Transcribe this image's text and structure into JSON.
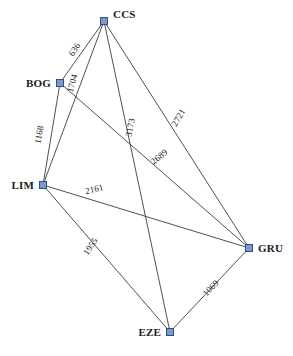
{
  "chart_data": {
    "type": "diagram",
    "title": "",
    "subtitle": "",
    "xlabel": "",
    "ylabel": "",
    "grid": false,
    "legend": "none",
    "background": "#ffffff",
    "node_fill": "#7b98c6",
    "node_stroke": "#2b4f86",
    "edge_color": "#3c3c3c",
    "label_color": "#1a1a1a",
    "nodes": [
      {
        "id": "CCS",
        "label": "CCS",
        "x": 104,
        "y": 21,
        "label_dx": 9,
        "label_dy": -3,
        "anchor": "start"
      },
      {
        "id": "BOG",
        "label": "BOG",
        "x": 60,
        "y": 83,
        "label_dx": -9,
        "label_dy": 4,
        "anchor": "end"
      },
      {
        "id": "LIM",
        "label": "LIM",
        "x": 43,
        "y": 185,
        "label_dx": -9,
        "label_dy": 4,
        "anchor": "end"
      },
      {
        "id": "GRU",
        "label": "GRU",
        "x": 249,
        "y": 248,
        "label_dx": 9,
        "label_dy": 4,
        "anchor": "start"
      },
      {
        "id": "EZE",
        "label": "EZE",
        "x": 170,
        "y": 332,
        "label_dx": -9,
        "label_dy": 4,
        "anchor": "end"
      }
    ],
    "edges": [
      {
        "source": "CCS",
        "target": "BOG",
        "weight": 636,
        "label": "636",
        "label_x": 77,
        "label_y": 51,
        "rotation": -58
      },
      {
        "source": "CCS",
        "target": "LIM",
        "weight": 1704,
        "label": "1704",
        "label_x": 75,
        "label_y": 84,
        "rotation": -74
      },
      {
        "source": "BOG",
        "target": "LIM",
        "weight": 1168,
        "label": "1168",
        "label_x": 42,
        "label_y": 135,
        "rotation": -80
      },
      {
        "source": "CCS",
        "target": "EZE",
        "weight": 3173,
        "label": "3173",
        "label_x": 133,
        "label_y": 128,
        "rotation": -79
      },
      {
        "source": "CCS",
        "target": "GRU",
        "weight": 2721,
        "label": "2721",
        "label_x": 181,
        "label_y": 119,
        "rotation": -59
      },
      {
        "source": "BOG",
        "target": "GRU",
        "weight": 2689,
        "label": "2689",
        "label_x": 161,
        "label_y": 159,
        "rotation": -39
      },
      {
        "source": "LIM",
        "target": "GRU",
        "weight": 2161,
        "label": "2161",
        "label_x": 95,
        "label_y": 192,
        "rotation": -14
      },
      {
        "source": "LIM",
        "target": "EZE",
        "weight": 1955,
        "label": "1955",
        "label_x": 93,
        "label_y": 248,
        "rotation": -56
      },
      {
        "source": "GRU",
        "target": "EZE",
        "weight": 1069,
        "label": "1069",
        "label_x": 213,
        "label_y": 290,
        "rotation": -47
      }
    ]
  }
}
